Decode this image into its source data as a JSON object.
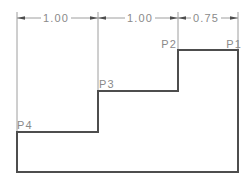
{
  "window": {
    "background": "#ffffff"
  },
  "drawing": {
    "kind": "stepped-profile-with-dimensions",
    "dimensions": [
      {
        "label": "1.00"
      },
      {
        "label": "1.00"
      },
      {
        "label": "0.75"
      }
    ],
    "points": [
      {
        "label": "P1"
      },
      {
        "label": "P2"
      },
      {
        "label": "P3"
      },
      {
        "label": "P4"
      }
    ],
    "colors": {
      "profile_stroke": "#4d4d4d",
      "dimension_stroke": "#9e9e9e",
      "label_text": "#8a8a8a",
      "background": "#ffffff"
    }
  }
}
